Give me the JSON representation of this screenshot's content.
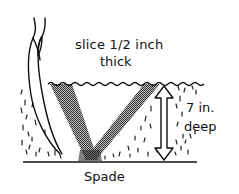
{
  "diagram": {
    "type": "soil-sampling-illustration",
    "labels": {
      "slice_line1": "slice 1/2 inch",
      "slice_line2": "thick",
      "depth_line1": "7 in.",
      "depth_line2": "deep",
      "tool": "Spade"
    },
    "elements": [
      {
        "name": "plant-stem",
        "description": "curved plant/grass stem on left"
      },
      {
        "name": "soil-surface",
        "description": "wavy line marking top of soil"
      },
      {
        "name": "v-cut",
        "description": "V-shaped cut with two shaded slice bands"
      },
      {
        "name": "depth-arrow",
        "description": "double-headed vertical arrow indicating depth"
      },
      {
        "name": "ground-baseline",
        "description": "horizontal line at bottom of cut"
      }
    ],
    "colors": {
      "ink": "#111111",
      "shading": "#6b6b6b",
      "background": "#ffffff"
    }
  }
}
